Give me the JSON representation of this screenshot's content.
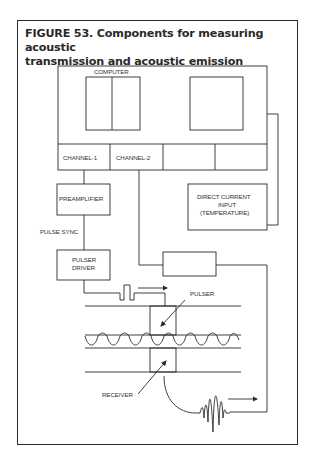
{
  "figure": {
    "title_line1": "FIGURE 53. Components for measuring acoustic",
    "title_line2": "transmission and acoustic emission"
  },
  "labels": {
    "computer": "COMPUTER",
    "channel1": "CHANNEL-1",
    "channel2": "CHANNEL-2",
    "preamplifier": "PREAMPLIFIER",
    "dc_input_line1": "DIRECT CURRENT",
    "dc_input_line2": "INPUT",
    "dc_input_line3": "(TEMPERATURE)",
    "pulse_sync": "PULSE SYNC",
    "pulser_driver_line1": "PULSER",
    "pulser_driver_line2": "DRIVER",
    "pulser": "PULSER",
    "receiver": "RECEIVER"
  },
  "colors": {
    "ink": "#2a2a2a",
    "background": "#ffffff"
  }
}
